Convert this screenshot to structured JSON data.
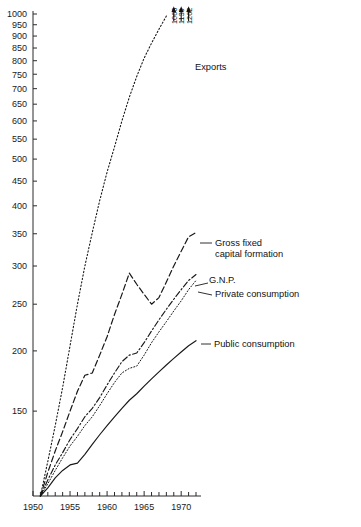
{
  "chart_data": {
    "type": "line",
    "title": "",
    "subtitle": "",
    "xlabel": "",
    "ylabel": "",
    "yscale": "log",
    "ylim": [
      100,
      1000
    ],
    "xlim": [
      1950,
      1972
    ],
    "grid": false,
    "legend_position": "inline-right-labels",
    "base_note": "Index, 1951 = 100",
    "ytick_labels": [
      "1000",
      "950",
      "900",
      "850",
      "800",
      "750",
      "700",
      "650",
      "600",
      "550",
      "500",
      "450",
      "400",
      "350",
      "300",
      "250",
      "200",
      "150"
    ],
    "ytick_values": [
      1000,
      950,
      900,
      850,
      800,
      750,
      700,
      650,
      600,
      550,
      500,
      450,
      400,
      350,
      300,
      250,
      200,
      150
    ],
    "xtick_labels": [
      "1950",
      "1955",
      "1960",
      "1965",
      "1970"
    ],
    "xtick_values": [
      1950,
      1955,
      1960,
      1965,
      1970
    ],
    "xtick_minor_values": [
      1951,
      1952,
      1953,
      1954,
      1956,
      1957,
      1958,
      1959,
      1961,
      1962,
      1963,
      1964,
      1966,
      1967,
      1968,
      1969,
      1971,
      1972
    ],
    "x": [
      1951,
      1952,
      1953,
      1954,
      1955,
      1956,
      1957,
      1958,
      1959,
      1960,
      1961,
      1962,
      1963,
      1964,
      1965,
      1966,
      1967,
      1968,
      1969,
      1970,
      1971,
      1972
    ],
    "series": [
      {
        "name": "Exports",
        "label": "Exports",
        "style": "dotted",
        "color": "#181818",
        "values": [
          100,
          118,
          140,
          168,
          205,
          250,
          300,
          352,
          410,
          470,
          530,
          600,
          672,
          742,
          810,
          870,
          930,
          990,
          1066,
          1139,
          1262,
          1262
        ]
      },
      {
        "name": "Gross fixed capital formation",
        "label": "Gross fixed capital formation",
        "style": "dashed",
        "color": "#181818",
        "values": [
          100,
          112,
          124,
          136,
          150,
          165,
          178,
          180,
          196,
          214,
          238,
          262,
          290,
          275,
          262,
          250,
          258,
          278,
          300,
          322,
          345,
          352
        ]
      },
      {
        "name": "G.N.P.",
        "label": "G.N.P.",
        "style": "dash-dot",
        "color": "#181818",
        "values": [
          100,
          108,
          116,
          123,
          131,
          138,
          146,
          152,
          160,
          170,
          180,
          190,
          196,
          198,
          208,
          220,
          232,
          244,
          256,
          268,
          280,
          288
        ]
      },
      {
        "name": "Private consumption",
        "label": "Private consumption",
        "style": "fine-dotted",
        "color": "#181818",
        "values": [
          100,
          106,
          113,
          120,
          127,
          133,
          140,
          146,
          154,
          163,
          172,
          180,
          184,
          186,
          196,
          208,
          219,
          230,
          242,
          254,
          268,
          280
        ]
      },
      {
        "name": "Public consumption",
        "label": "Public consumption",
        "style": "solid",
        "color": "#181818",
        "values": [
          100,
          104,
          109,
          113,
          116,
          117,
          122,
          128,
          134,
          140,
          146,
          152,
          158,
          163,
          169,
          175,
          181,
          187,
          193,
          199,
          205,
          210
        ]
      }
    ],
    "annotations": [
      {
        "name": "arrow-value-1",
        "value": "1066",
        "x": 1969,
        "points": "up"
      },
      {
        "name": "arrow-value-2",
        "value": "1139",
        "x": 1970,
        "points": "up"
      },
      {
        "name": "arrow-value-3",
        "value": "1262",
        "x": 1971,
        "points": "up"
      }
    ]
  }
}
